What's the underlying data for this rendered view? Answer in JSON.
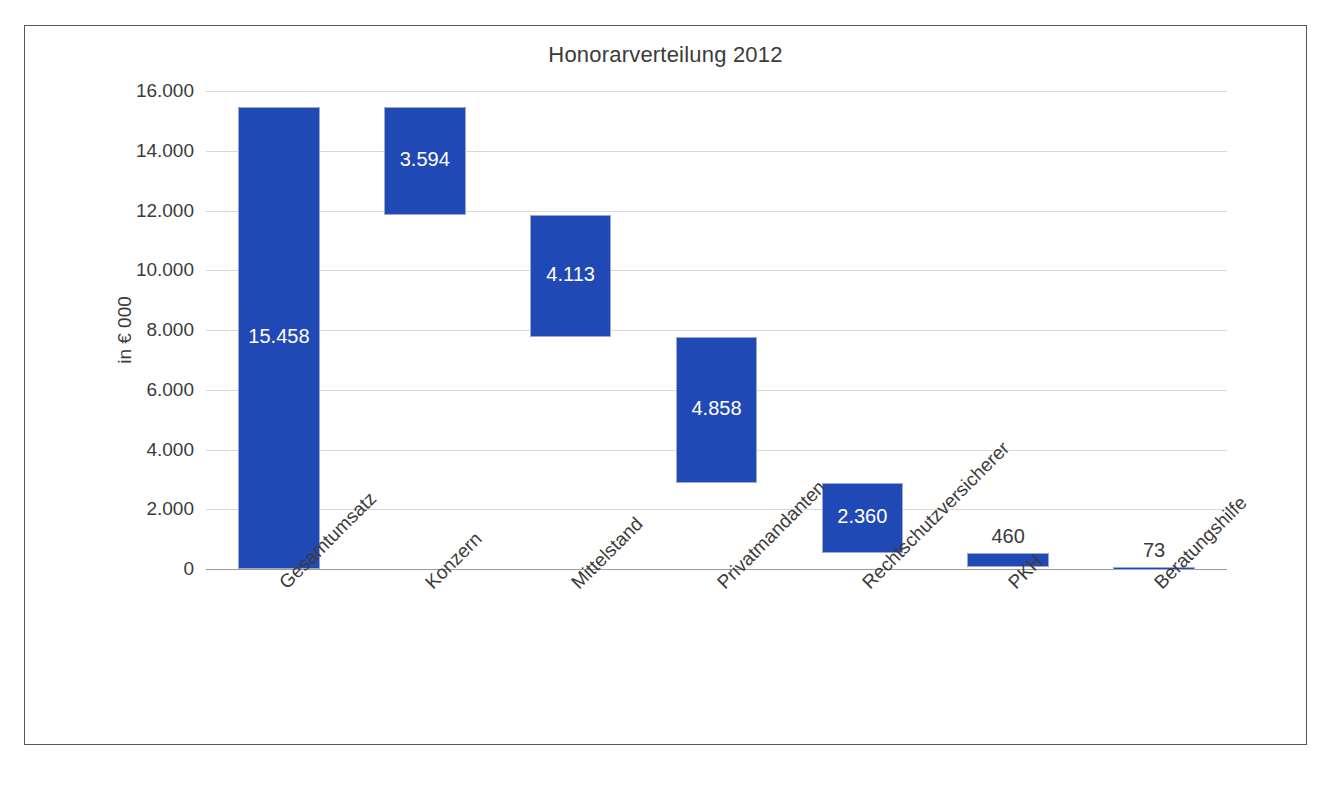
{
  "frame": {
    "border_color": "#54585c",
    "background": "#ffffff"
  },
  "chart_data": {
    "type": "bar",
    "subtype": "waterfall",
    "title": "Honorarverteilung 2012",
    "xlabel": "",
    "ylabel": "in € 000",
    "ylim": [
      0,
      16000
    ],
    "ytick_step": 2000,
    "grid": true,
    "legend": false,
    "bar_color": "#2149b5",
    "categories": [
      "Gesamtumsatz",
      "Konzern",
      "Mittelstand",
      "Privatmandanten",
      "Rechtschutzversicherer",
      "PKH",
      "Beratungshilfe"
    ],
    "values": [
      15458,
      3594,
      4113,
      4858,
      2360,
      460,
      73
    ],
    "value_labels": [
      "15.458",
      "3.594",
      "4.113",
      "4.858",
      "2.360",
      "460",
      "73"
    ],
    "bar_base": [
      0,
      11864,
      7751,
      2893,
      533,
      73,
      0
    ],
    "bar_top": [
      15458,
      15458,
      11864,
      7751,
      2893,
      533,
      73
    ],
    "label_inside": [
      true,
      true,
      true,
      true,
      true,
      false,
      false
    ],
    "ytick_labels": [
      "16.000",
      "14.000",
      "12.000",
      "10.000",
      "8.000",
      "6.000",
      "4.000",
      "2.000",
      "0"
    ],
    "ytick_values": [
      16000,
      14000,
      12000,
      10000,
      8000,
      6000,
      4000,
      2000,
      0
    ]
  }
}
